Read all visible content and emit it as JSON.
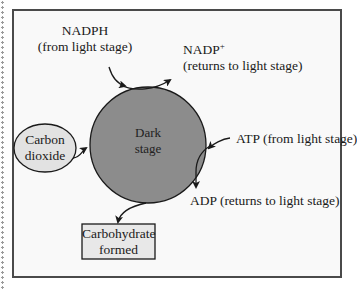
{
  "diagram": {
    "nodes": {
      "dark_stage": {
        "line1": "Dark",
        "line2": "stage",
        "fill": "#8c8c8c"
      },
      "carbon_dioxide": {
        "line1": "Carbon",
        "line2": "dioxide",
        "fill": "#e2e2e2"
      },
      "carbohydrate": {
        "line1": "Carbohydrate",
        "line2": "formed",
        "fill": "#e8e8e8"
      }
    },
    "labels": {
      "nadph": {
        "line1": "NADPH",
        "line2": "(from light stage)"
      },
      "nadp": {
        "line1_main": "NADP",
        "line1_sup": "+",
        "line2": "(returns to light stage)"
      },
      "atp": {
        "text": "ATP (from light stage)"
      },
      "adp": {
        "text": "ADP (returns to light stage)"
      }
    },
    "edges": [
      {
        "from": "NADPH",
        "to": "Dark stage",
        "direction": "in"
      },
      {
        "from": "Dark stage",
        "to": "NADP+",
        "direction": "out"
      },
      {
        "from": "Carbon dioxide",
        "to": "Dark stage",
        "direction": "in"
      },
      {
        "from": "ATP",
        "to": "Dark stage",
        "direction": "in"
      },
      {
        "from": "Dark stage",
        "to": "ADP",
        "direction": "out"
      },
      {
        "from": "Dark stage",
        "to": "Carbohydrate formed",
        "direction": "out"
      }
    ],
    "colors": {
      "frame_border": "#4a4a4a",
      "background": "#f9f9f9",
      "line": "#1a1a1a"
    }
  }
}
